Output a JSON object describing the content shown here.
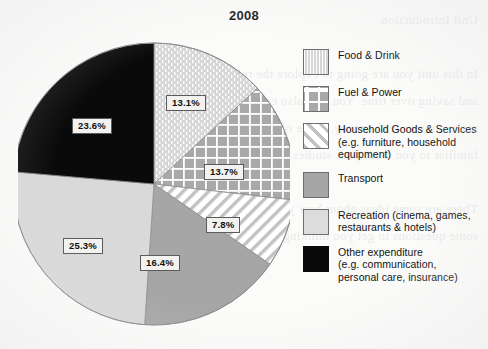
{
  "chart_data": {
    "type": "pie",
    "title": "2008",
    "categories": [
      "Food & Drink",
      "Fuel & Power",
      "Household Goods & Services",
      "Transport",
      "Recreation",
      "Other expenditure"
    ],
    "values": [
      13.1,
      13.7,
      7.8,
      16.4,
      25.3,
      23.6
    ],
    "value_labels": [
      "13.1%",
      "13.7%",
      "7.8%",
      "16.4%",
      "25.3%",
      "23.6%"
    ],
    "unit": "%",
    "start_angle_deg": 0,
    "direction": "clockwise",
    "legend_position": "right",
    "grid": false,
    "xlabel": "",
    "ylabel": ""
  },
  "chart": {
    "title": "2008",
    "slices": [
      {
        "id": "food-drink",
        "name": "Food & Drink",
        "value": 13.1,
        "label": "13.1%",
        "pattern": "vertical-dotted",
        "fill": "#d4d4d4",
        "pattern_color": "#ffffff"
      },
      {
        "id": "fuel-power",
        "name": "Fuel & Power",
        "value": 13.7,
        "label": "13.7%",
        "pattern": "grid",
        "fill": "#a9a9a9",
        "pattern_color": "#ffffff"
      },
      {
        "id": "household-goods",
        "name": "Household Goods & Services",
        "value": 7.8,
        "label": "7.8%",
        "pattern": "diagonal-stripes",
        "fill": "#ffffff",
        "pattern_color": "#bdbdbd"
      },
      {
        "id": "transport",
        "name": "Transport",
        "value": 16.4,
        "label": "16.4%",
        "pattern": "solid",
        "fill": "#a6a6a6",
        "pattern_color": "#a6a6a6"
      },
      {
        "id": "recreation",
        "name": "Recreation",
        "value": 25.3,
        "label": "25.3%",
        "pattern": "solid",
        "fill": "#d9d9d9",
        "pattern_color": "#d9d9d9"
      },
      {
        "id": "other-expenditure",
        "name": "Other expenditure",
        "value": 23.6,
        "label": "23.6%",
        "pattern": "solid",
        "fill": "#0a0a0a",
        "pattern_color": "#0a0a0a"
      }
    ]
  },
  "legend": {
    "items": [
      {
        "id": "food-drink",
        "label": "Food & Drink",
        "swatch": "swatch-vertical-dotted"
      },
      {
        "id": "fuel-power",
        "label": "Fuel & Power",
        "swatch": "swatch-grid"
      },
      {
        "id": "household-goods",
        "label": "Household Goods & Services\n(e.g. furniture, household\nequipment)",
        "swatch": "swatch-diagonal-stripes"
      },
      {
        "id": "transport",
        "label": "Transport",
        "swatch": "swatch-solid-mid-gray"
      },
      {
        "id": "recreation",
        "label": "Recreation (cinema, games,\nrestaurants & hotels)",
        "swatch": "swatch-solid-light-gray"
      },
      {
        "id": "other-expenditure",
        "label": "Other expenditure\n(e.g. communication,\npersonal care, insurance)",
        "swatch": "swatch-solid-black"
      }
    ]
  },
  "colors": {
    "text": "#111111",
    "label_box_bg": "#f2f2f1",
    "label_box_border": "#5b5b5b",
    "pie_outline": "#6e6e6e",
    "page_bg": "#fbfbfa"
  },
  "background_bleed": "Unit Introduction\n\nIn this unit you are going to explore the relationship between spending\nand saving over time. You will also consider how different households\nmake choices with money. Some of these ideas may already be\nfamiliar to you from your studies.\n\nThere are some ideas about how you might approach the tasks, and\nsome questions to get you thinking about the issues."
}
